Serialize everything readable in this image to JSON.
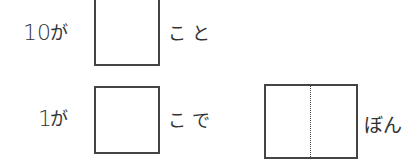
{
  "rows": [
    {
      "number": "10",
      "particle": "が",
      "suffix": "こと"
    },
    {
      "number": "1",
      "particle": "が",
      "suffix": "こで"
    }
  ],
  "result": {
    "suffix": "ぼん"
  },
  "answer_boxes": [
    {
      "value": ""
    },
    {
      "value": ""
    },
    {
      "value": ""
    }
  ]
}
